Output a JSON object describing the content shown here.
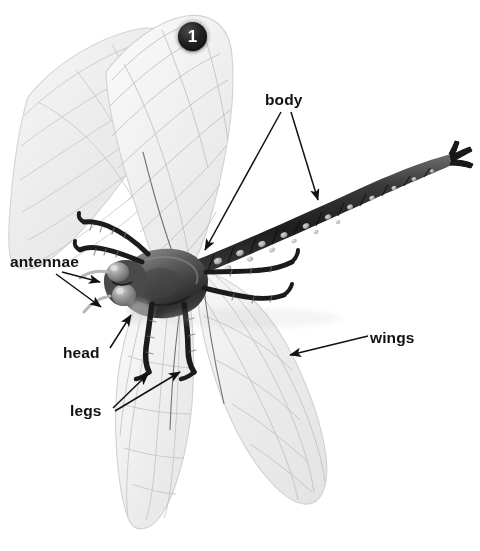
{
  "figure": {
    "number_badge": "1",
    "background_color": "#ffffff",
    "ink_color": "#111111"
  },
  "labels": [
    {
      "id": "body",
      "text": "body",
      "x": 265,
      "y": 92,
      "arrow_count": 2
    },
    {
      "id": "antennae",
      "text": "antennae",
      "x": 10,
      "y": 254,
      "arrow_count": 2
    },
    {
      "id": "head",
      "text": "head",
      "x": 63,
      "y": 345,
      "arrow_count": 1
    },
    {
      "id": "legs",
      "text": "legs",
      "x": 70,
      "y": 403,
      "arrow_count": 2
    },
    {
      "id": "wings",
      "text": "wings",
      "x": 370,
      "y": 330,
      "arrow_count": 1
    }
  ],
  "anatomy_parts": {
    "wings": "four translucent pale grey veined wings",
    "body": "long segmented dark abdomen extending to upper right",
    "head": "dark head with two large compound eyes",
    "antennae": "two short pale antennae at front of head",
    "legs": "dark jointed legs beneath the thorax"
  }
}
